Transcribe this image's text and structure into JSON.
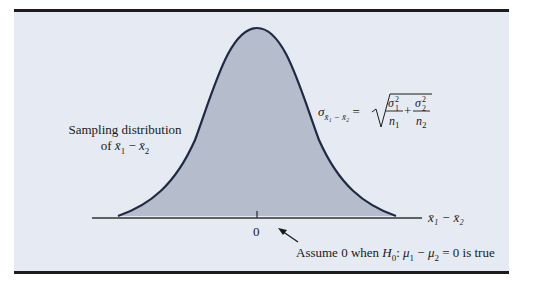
{
  "figure": {
    "type": "normal-distribution-diagram",
    "colors": {
      "panel_background": "#e6eaf2",
      "curve_fill": "#b5bccb",
      "curve_stroke": "#1f2a44",
      "axis": "#333333",
      "rule": "#1c1c1c"
    },
    "left_label": {
      "line1": "Sampling distribution",
      "line2_prefix": "of ",
      "line2_var1": "x̄",
      "line2_sub1": "1",
      "line2_minus": " − ",
      "line2_var2": "x̄",
      "line2_sub2": "2"
    },
    "formula": {
      "lhs_symbol": "σ",
      "lhs_subscript": "x̄₁ − x̄₂",
      "equals": " = ",
      "term1_num": "σ",
      "term1_num_sup": "2",
      "term1_num_sub": "1",
      "term1_den": "n",
      "term1_den_sub": "1",
      "plus": "+",
      "term2_num": "σ",
      "term2_num_sup": "2",
      "term2_num_sub": "2",
      "term2_den": "n",
      "term2_den_sub": "2"
    },
    "axis": {
      "variable_label": "x̄₁ − x̄₂",
      "tick_label": "0"
    },
    "annotation": {
      "prefix": "Assume 0 when ",
      "h": "H",
      "h_sub": "0",
      "colon": ": ",
      "mu1": "μ",
      "mu1_sub": "1",
      "minus": " − ",
      "mu2": "μ",
      "mu2_sub": "2",
      "suffix": " = 0 is true"
    }
  }
}
